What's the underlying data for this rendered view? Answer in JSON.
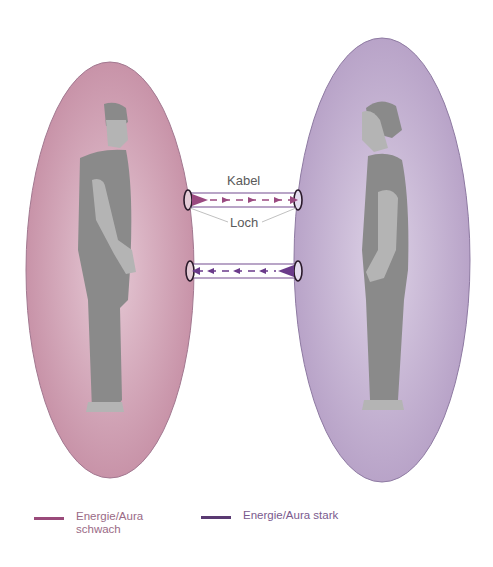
{
  "diagram": {
    "left_person": {
      "aura_color": "#c896ac",
      "aura_stroke": "#a27890",
      "figure_dark": "#8a8a8a",
      "figure_light": "#b4b4b4"
    },
    "right_person": {
      "aura_color": "#bba6c8",
      "aura_stroke": "#8e7aa2",
      "figure_dark": "#8a8a8a",
      "figure_light": "#b4b4b4"
    },
    "cables": [
      {
        "direction": "left-to-right",
        "arrow_color": "#9a4a80"
      },
      {
        "direction": "right-to-left",
        "arrow_color": "#6a3a8a"
      }
    ],
    "labels": {
      "cable": "Kabel",
      "hole": "Loch"
    }
  },
  "legend": {
    "items": [
      {
        "label_line1": "Energie/Aura",
        "label_line2": "schwach",
        "color": "#9a4a7a"
      },
      {
        "label_line1": "Energie/Aura stark",
        "label_line2": "",
        "color": "#5a3a72"
      }
    ]
  }
}
